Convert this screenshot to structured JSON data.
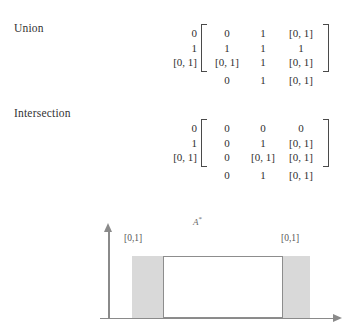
{
  "sections": {
    "union": {
      "caption": "Union",
      "row_labels": [
        "0",
        "1",
        "[0, 1]"
      ],
      "rows": [
        [
          "0",
          "1",
          "[0, 1]"
        ],
        [
          "1",
          "1",
          "1"
        ],
        [
          "[0, 1]",
          "1",
          "[0, 1]"
        ]
      ],
      "bottom_row": [
        "0",
        "1",
        "[0, 1]"
      ]
    },
    "intersection": {
      "caption": "Intersection",
      "row_labels": [
        "0",
        "1",
        "[0, 1]"
      ],
      "rows": [
        [
          "0",
          "0",
          "0"
        ],
        [
          "0",
          "1",
          "[0, 1]"
        ],
        [
          "0",
          "[0, 1]",
          "[0, 1]"
        ]
      ],
      "bottom_row": [
        "0",
        "1",
        "[0, 1]"
      ]
    }
  },
  "figure": {
    "set_label": "A",
    "set_label_sup": "*",
    "left_band_label": "[0,1]",
    "right_band_label": "[0,1]",
    "band_color": "#d9d9d9",
    "axis_color": "#8a8a8a",
    "core_border_color": "#8d8d8d"
  }
}
